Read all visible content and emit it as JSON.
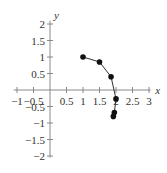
{
  "chart_data": {
    "type": "line",
    "title": "",
    "xlabel": "x",
    "ylabel": "y",
    "xlim": [
      -1.1,
      3.1
    ],
    "ylim": [
      -2,
      2.2
    ],
    "grid": false,
    "x_ticks": [
      -1,
      -0.5,
      0.5,
      1,
      1.5,
      2,
      2.5,
      3
    ],
    "x_tick_labels": [
      "−1",
      "−0.5",
      "0.5",
      "1",
      "1.5",
      "2",
      "2.5",
      "3"
    ],
    "y_ticks": [
      2,
      1.5,
      1,
      0.5,
      -0.5,
      -1,
      -1.5,
      -2
    ],
    "y_tick_labels": [
      "2",
      "1.5",
      "1",
      "0.5",
      "−0.5",
      "−1",
      "−1.5",
      "−2"
    ],
    "series": [
      {
        "name": "path",
        "x": [
          1.0,
          1.5,
          1.85,
          2.0,
          1.95,
          1.92
        ],
        "y": [
          1.0,
          0.85,
          0.4,
          -0.27,
          -0.68,
          -0.8
        ]
      }
    ],
    "colors": {
      "line": "#333333",
      "axes": "#888888",
      "markers": "#111111"
    }
  }
}
